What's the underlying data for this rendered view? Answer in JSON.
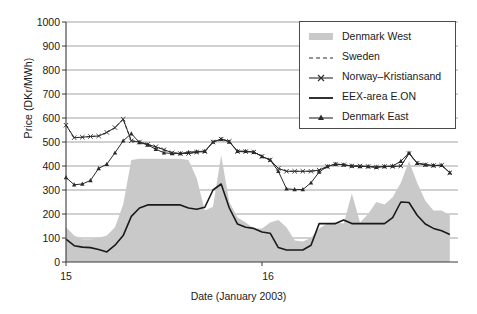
{
  "chart_data": {
    "type": "line",
    "title": "",
    "xlabel": "Date (January 2003)",
    "ylabel": "Price (DKr/MWh)",
    "ylim": [
      0,
      1000
    ],
    "yticks": [
      0,
      100,
      200,
      300,
      400,
      500,
      600,
      700,
      800,
      900,
      1000
    ],
    "xlim": [
      0,
      48
    ],
    "xticks": [
      0,
      24
    ],
    "xticklabels": [
      "15",
      "16"
    ],
    "grid": "horizontal",
    "legend_position": "top-right",
    "x": [
      0,
      1,
      2,
      3,
      4,
      5,
      6,
      7,
      8,
      9,
      10,
      11,
      12,
      13,
      14,
      15,
      16,
      17,
      18,
      19,
      20,
      21,
      22,
      23,
      24,
      25,
      26,
      27,
      28,
      29,
      30,
      31,
      32,
      33,
      34,
      35,
      36,
      37,
      38,
      39,
      40,
      41,
      42,
      43,
      44,
      45,
      46,
      47
    ],
    "series": [
      {
        "name": "Denmark West",
        "style": "area",
        "color": "#c9c9c9",
        "values": [
          145,
          110,
          95,
          95,
          100,
          110,
          145,
          240,
          425,
          430,
          430,
          430,
          430,
          430,
          430,
          425,
          350,
          215,
          230,
          445,
          250,
          185,
          165,
          140,
          140,
          165,
          175,
          145,
          90,
          85,
          100,
          140,
          160,
          165,
          160,
          285,
          165,
          200,
          250,
          240,
          270,
          330,
          420,
          330,
          255,
          215,
          215,
          195
        ]
      },
      {
        "name": "Sweden",
        "style": "dashed",
        "color": "#2a2a2a",
        "values": [
          570,
          518,
          520,
          523,
          525,
          540,
          560,
          595,
          505,
          500,
          490,
          480,
          468,
          455,
          452,
          452,
          458,
          460,
          500,
          512,
          503,
          460,
          460,
          458,
          440,
          425,
          390,
          378,
          378,
          378,
          378,
          383,
          398,
          408,
          405,
          400,
          400,
          398,
          395,
          398,
          398,
          400,
          452,
          412,
          405,
          402,
          403,
          372
        ]
      },
      {
        "name": "Norway-Kristiansand",
        "style": "line-x",
        "color": "#2a2a2a",
        "values": [
          570,
          518,
          520,
          523,
          525,
          540,
          560,
          595,
          505,
          500,
          490,
          480,
          468,
          455,
          452,
          452,
          458,
          460,
          500,
          512,
          503,
          460,
          460,
          458,
          440,
          425,
          390,
          378,
          378,
          378,
          378,
          383,
          398,
          408,
          405,
          400,
          400,
          398,
          395,
          398,
          398,
          400,
          452,
          412,
          405,
          402,
          403,
          372
        ]
      },
      {
        "name": "EEX-area E.ON",
        "style": "solid",
        "color": "#1a1a1a",
        "values": [
          95,
          68,
          62,
          60,
          52,
          42,
          70,
          110,
          190,
          225,
          238,
          238,
          238,
          238,
          238,
          225,
          220,
          228,
          300,
          325,
          225,
          158,
          145,
          140,
          125,
          120,
          60,
          50,
          50,
          50,
          70,
          160,
          160,
          160,
          175,
          160,
          160,
          160,
          160,
          160,
          185,
          250,
          248,
          195,
          158,
          140,
          130,
          115
        ]
      },
      {
        "name": "Denmark East",
        "style": "line-tri",
        "color": "#2a2a2a",
        "values": [
          352,
          322,
          325,
          340,
          390,
          408,
          455,
          505,
          535,
          498,
          488,
          470,
          455,
          452,
          452,
          458,
          460,
          462,
          500,
          512,
          500,
          462,
          462,
          458,
          440,
          425,
          378,
          305,
          302,
          302,
          330,
          375,
          398,
          408,
          405,
          400,
          398,
          398,
          395,
          398,
          400,
          420,
          455,
          412,
          405,
          402,
          403,
          372
        ]
      }
    ]
  },
  "axis": {
    "ylabel": "Price (DKr/MWh)",
    "xlabel": "Date (January 2003)",
    "yticks": [
      "1000",
      "900",
      "800",
      "700",
      "600",
      "500",
      "400",
      "300",
      "200",
      "100",
      "0"
    ],
    "xticks": [
      "15",
      "16"
    ]
  },
  "legend": {
    "items": [
      {
        "label": "Denmark West",
        "symbol": "area-swatch"
      },
      {
        "label": "Sweden",
        "symbol": "dashed-line"
      },
      {
        "label": "Norway–Kristiansand",
        "symbol": "line-with-x-marker"
      },
      {
        "label": "EEX-area E.ON",
        "symbol": "solid-line"
      },
      {
        "label": "Denmark East",
        "symbol": "line-with-triangle-marker"
      }
    ]
  },
  "colors": {
    "area_fill": "#c9c9c9",
    "line_dark": "#2a2a2a",
    "grid": "#8c8c8c",
    "axis": "#3a3a3a"
  }
}
